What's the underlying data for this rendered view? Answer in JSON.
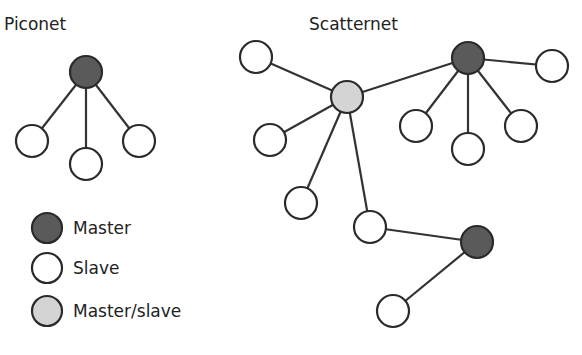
{
  "diagram": {
    "piconet": {
      "title": "Piconet",
      "title_pos": [
        4,
        30
      ],
      "nodes": [
        {
          "id": "p_m",
          "role": "master",
          "x": 86,
          "y": 72
        },
        {
          "id": "p_s1",
          "role": "slave",
          "x": 32,
          "y": 141
        },
        {
          "id": "p_s2",
          "role": "slave",
          "x": 86,
          "y": 164
        },
        {
          "id": "p_s3",
          "role": "slave",
          "x": 139,
          "y": 141
        }
      ],
      "edges": [
        [
          "p_m",
          "p_s1"
        ],
        [
          "p_m",
          "p_s2"
        ],
        [
          "p_m",
          "p_s3"
        ]
      ]
    },
    "scatternet": {
      "title": "Scatternet",
      "title_pos": [
        309,
        30
      ],
      "nodes": [
        {
          "id": "s_ms",
          "role": "master_slave",
          "x": 347,
          "y": 97
        },
        {
          "id": "s_a",
          "role": "slave",
          "x": 256,
          "y": 57
        },
        {
          "id": "s_b",
          "role": "slave",
          "x": 270,
          "y": 140
        },
        {
          "id": "s_c",
          "role": "slave",
          "x": 301,
          "y": 203
        },
        {
          "id": "s_d",
          "role": "slave",
          "x": 370,
          "y": 227
        },
        {
          "id": "s_m1",
          "role": "master",
          "x": 468,
          "y": 58
        },
        {
          "id": "s_e",
          "role": "slave",
          "x": 552,
          "y": 66
        },
        {
          "id": "s_f",
          "role": "slave",
          "x": 416,
          "y": 126
        },
        {
          "id": "s_g",
          "role": "slave",
          "x": 468,
          "y": 149
        },
        {
          "id": "s_h",
          "role": "slave",
          "x": 521,
          "y": 126
        },
        {
          "id": "s_m2",
          "role": "master",
          "x": 477,
          "y": 242
        },
        {
          "id": "s_i",
          "role": "slave",
          "x": 393,
          "y": 311
        }
      ],
      "edges": [
        [
          "s_ms",
          "s_a"
        ],
        [
          "s_ms",
          "s_b"
        ],
        [
          "s_ms",
          "s_c"
        ],
        [
          "s_ms",
          "s_d"
        ],
        [
          "s_ms",
          "s_m1"
        ],
        [
          "s_m1",
          "s_e"
        ],
        [
          "s_m1",
          "s_f"
        ],
        [
          "s_m1",
          "s_g"
        ],
        [
          "s_m1",
          "s_h"
        ],
        [
          "s_d",
          "s_m2"
        ],
        [
          "s_m2",
          "s_i"
        ]
      ]
    },
    "node_radius": 16,
    "colors": {
      "master": "#5a5a5a",
      "slave": "#ffffff",
      "master_slave": "#d4d4d4",
      "stroke": "#2a2a2a"
    },
    "legend": [
      {
        "role": "master",
        "label": "Master",
        "x": 47,
        "y": 228
      },
      {
        "role": "slave",
        "label": "Slave",
        "x": 47,
        "y": 268
      },
      {
        "role": "master_slave",
        "label": "Master/slave",
        "x": 47,
        "y": 311
      }
    ]
  }
}
